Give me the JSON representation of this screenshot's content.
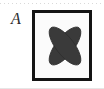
{
  "panel": {
    "label": "A",
    "label_style": "italic-serif",
    "background_color": "#ffffff"
  },
  "frame": {
    "border_color": "#141414",
    "border_width_px": 3,
    "inner_background": "#fbfbfb",
    "x": 32,
    "y": 10,
    "width": 60,
    "height": 71
  },
  "shape": {
    "name": "crossed-ellipses-x",
    "description": "two elongated ellipses crossed to form an X / four-petal motif",
    "fill_color": "#3a3a3a",
    "stroke_color": "#2e2e2e",
    "center_x": 30,
    "center_y": 33,
    "ellipse_rx": 9,
    "ellipse_ry": 23,
    "rotation_a_deg": 38,
    "rotation_b_deg": -38
  },
  "decorations": {
    "top_rule_color": "#b9b9b9",
    "top_rule_style": "dotted",
    "bottom_rule_color": "#e6e6e6"
  }
}
